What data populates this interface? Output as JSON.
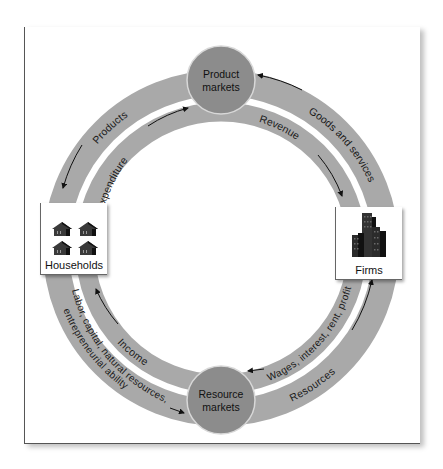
{
  "diagram": {
    "colors": {
      "band": "#a9a9a9",
      "market_circle": "#8c8c8c",
      "frame_border": "#555555",
      "arrow": "#111111",
      "icon": "#2a2a2a"
    },
    "markets": {
      "product": {
        "line1": "Product",
        "line2": "markets"
      },
      "resource": {
        "line1": "Resource",
        "line2": "markets"
      }
    },
    "nodes": {
      "households": {
        "label": "Households",
        "icon": "house-icon",
        "count": 4
      },
      "firms": {
        "label": "Firms",
        "icon": "building-icon"
      }
    },
    "outer_flows": {
      "products": "Products",
      "goods_services": "Goods and services",
      "resources": "Resources",
      "factors_line1": "Labor, capital, natural resources,",
      "factors_line2": "entrepreneurial ability"
    },
    "inner_flows": {
      "expenditure": "Expenditure",
      "revenue": "Revenue",
      "wages": "Wages, interest, rent, profit",
      "income": "Income"
    }
  }
}
